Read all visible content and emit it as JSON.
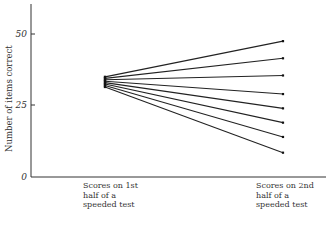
{
  "chart_data": {
    "type": "line",
    "title": "",
    "xlabel": "",
    "ylabel": "Number of items correct",
    "ylim": [
      0,
      60
    ],
    "yticks": [
      0,
      25,
      50
    ],
    "ytick_labels": [
      "0",
      "25",
      "50"
    ],
    "categories": [
      "Scores on 1st half of a speeded test",
      "Scores on 2nd half of a speeded test"
    ],
    "grid": false,
    "legend": null,
    "series": [
      {
        "name": "Line 1",
        "values": [
          35,
          47.5
        ]
      },
      {
        "name": "Line 2",
        "values": [
          34.5,
          41.5
        ]
      },
      {
        "name": "Line 3",
        "values": [
          34,
          35.5
        ]
      },
      {
        "name": "Line 4",
        "values": [
          33.5,
          29
        ]
      },
      {
        "name": "Line 5",
        "values": [
          33,
          24
        ]
      },
      {
        "name": "Line 6",
        "values": [
          32.5,
          19
        ]
      },
      {
        "name": "Line 7",
        "values": [
          32,
          14
        ]
      },
      {
        "name": "Line 8",
        "values": [
          31.5,
          8.5
        ]
      }
    ]
  },
  "labels": {
    "ylabel": "Number of items correct",
    "y0": "0",
    "y25": "25",
    "y50": "50",
    "cat1": "Scores on 1st\nhalf of a\nspeeded test",
    "cat2": "Scores on 2nd\nhalf of a\nspeeded test"
  }
}
